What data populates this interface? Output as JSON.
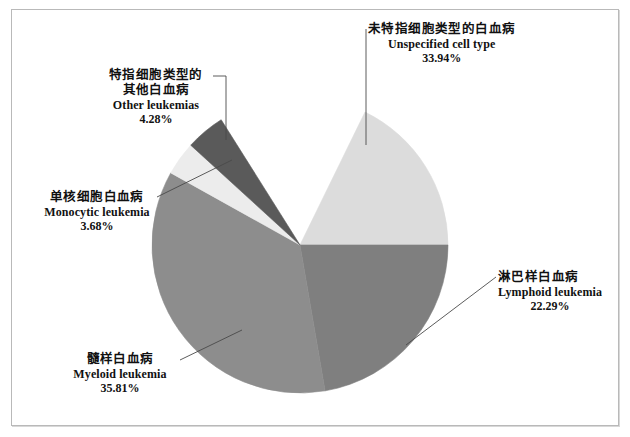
{
  "figure": {
    "background": "#ffffff",
    "frame_color": "#b9b9b9"
  },
  "chart_data": {
    "type": "pie",
    "title": "",
    "categories": [
      "未特指细胞类型的白血病 / Unspecified cell type",
      "淋巴样白血病 / Lymphoid leukemia",
      "髓样白血病 / Myeloid leukemia",
      "单核细胞白血病 / Monocytic leukemia",
      "特指细胞类型的其他白血病 / Other leukemias"
    ],
    "values": [
      33.94,
      22.29,
      35.81,
      3.68,
      4.28
    ],
    "unit": "%",
    "legend": "none",
    "start_angle_deg": 0,
    "direction": "clockwise",
    "slices": [
      {
        "key": "unspecified",
        "label_cn": "未特指细胞类型的白血病",
        "label_en": "Unspecified cell type",
        "value": 33.94,
        "percent": "33.94%",
        "color": "#dcdcdc",
        "start_deg": 296.06,
        "end_deg": 360.0
      },
      {
        "key": "lymphoid",
        "label_cn": "淋巴样白血病",
        "label_en": "Lymphoid leukemia",
        "value": 22.29,
        "percent": "22.29%",
        "color": "#7f7f7f",
        "start_deg": 0.0,
        "end_deg": 80.24
      },
      {
        "key": "myeloid",
        "label_cn": "髓样白血病",
        "label_en": "Myeloid leukemia",
        "value": 35.81,
        "percent": "35.81%",
        "color": "#8d8d8d",
        "start_deg": 80.24,
        "end_deg": 209.16
      },
      {
        "key": "monocytic",
        "label_cn": "单核细胞白血病",
        "label_en": "Monocytic leukemia",
        "value": 3.68,
        "percent": "3.68%",
        "color": "#ececec",
        "start_deg": 209.16,
        "end_deg": 222.41
      },
      {
        "key": "other",
        "label_cn": "特指细胞类型的",
        "label_cn2": "其他白血病",
        "label_en": "Other leukemias",
        "value": 4.28,
        "percent": "4.28%",
        "color": "#5a5a5a",
        "start_deg": 222.41,
        "end_deg": 237.82
      }
    ],
    "geometry": {
      "cx": 300,
      "cy": 245,
      "r": 148
    }
  },
  "labels": {
    "unspecified": {
      "cn": "未特指细胞类型的白血病",
      "en": "Unspecified cell type",
      "pct": "33.94%"
    },
    "other": {
      "cn_line1": "特指细胞类型的",
      "cn_line2": "其他白血病",
      "en": "Other leukemias",
      "pct": "4.28%"
    },
    "monocytic": {
      "cn": "单核细胞白血病",
      "en": "Monocytic leukemia",
      "pct": "3.68%"
    },
    "myeloid": {
      "cn": "髓样白血病",
      "en": "Myeloid leukemia",
      "pct": "35.81%"
    },
    "lymphoid": {
      "cn": "淋巴样白血病",
      "en": "Lymphoid leukemia",
      "pct": "22.29%"
    }
  }
}
